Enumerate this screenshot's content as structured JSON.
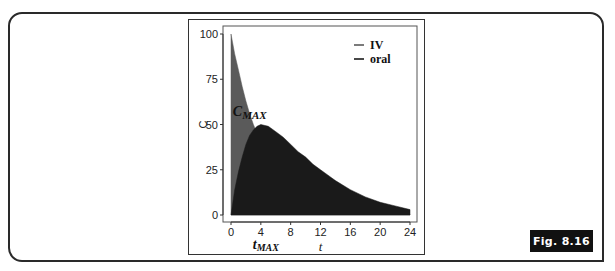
{
  "figure": {
    "label": "Fig. 8.16"
  },
  "chart_data": {
    "type": "area",
    "title": "",
    "xlabel": "t",
    "ylabel": "C",
    "xlim": [
      0,
      24
    ],
    "ylim": [
      0,
      100
    ],
    "x_ticks": [
      0,
      4,
      8,
      12,
      16,
      20,
      24
    ],
    "y_ticks": [
      0,
      25,
      50,
      75,
      100
    ],
    "grid": false,
    "legend_position": "top-right",
    "series": [
      {
        "name": "IV",
        "color": "#5a5a5a",
        "x": [
          0,
          0.5,
          1,
          1.5,
          2,
          2.5,
          3,
          3.5,
          4,
          5,
          6,
          8,
          10,
          12,
          16,
          20,
          24
        ],
        "values": [
          100,
          89,
          80,
          71,
          63,
          56,
          50,
          45,
          40,
          32,
          25,
          16,
          10,
          6,
          2.5,
          1,
          0.4
        ]
      },
      {
        "name": "oral",
        "color": "#1a1a1a",
        "x": [
          0,
          0.5,
          1,
          1.5,
          2,
          2.5,
          3,
          3.5,
          4,
          5,
          6,
          7,
          8,
          9,
          10,
          11,
          12,
          13,
          14,
          16,
          18,
          20,
          22,
          24
        ],
        "values": [
          0,
          14,
          24,
          32,
          39,
          44,
          47,
          49,
          50,
          49,
          46,
          43,
          39,
          35,
          32,
          28,
          25,
          22,
          19,
          14,
          10,
          7,
          5,
          3
        ]
      }
    ],
    "annotations": [
      {
        "text_main": "C",
        "text_sub": "MAX",
        "x": 4,
        "y": 55,
        "meaning": "peak concentration"
      },
      {
        "text_main": "t",
        "text_sub": "MAX",
        "x": 4,
        "y": "below x-axis",
        "meaning": "time of peak"
      }
    ]
  }
}
